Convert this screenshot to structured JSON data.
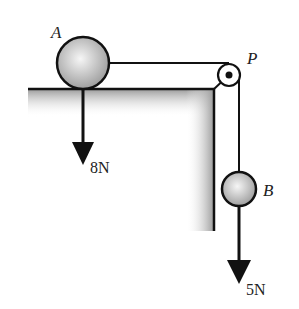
{
  "diagram": {
    "labels": {
      "ball_a": "A",
      "ball_b": "B",
      "pulley": "P",
      "force_a": "8N",
      "force_b": "5N"
    },
    "colors": {
      "line": "#111111",
      "shade": "#9a9a9a",
      "ball_light": "#f4f4f4",
      "ball_dark": "#9c9c9c"
    }
  }
}
